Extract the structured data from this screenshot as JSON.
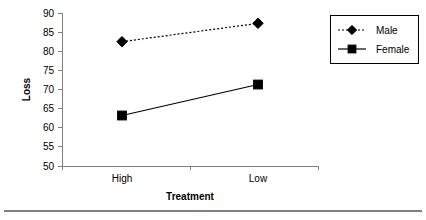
{
  "chart_data": {
    "type": "line",
    "title": "",
    "xlabel": "Treatment",
    "ylabel": "Loss",
    "categories": [
      "High",
      "Low"
    ],
    "series": [
      {
        "name": "Male",
        "values": [
          82.5,
          87.3
        ],
        "marker": "diamond",
        "line_style": "dashed",
        "color": "#000000"
      },
      {
        "name": "Female",
        "values": [
          63.2,
          71.3
        ],
        "marker": "square",
        "line_style": "solid",
        "color": "#000000"
      }
    ],
    "ylim": [
      50,
      90
    ],
    "ytick_step": 5,
    "yticks": [
      50,
      55,
      60,
      65,
      70,
      75,
      80,
      85,
      90
    ],
    "ytick_labels": [
      "50",
      "55",
      "60",
      "65",
      "70",
      "75",
      "80",
      "85",
      "90"
    ],
    "xticks": [
      "High",
      "Low"
    ],
    "grid": false,
    "legend_position": "right-top",
    "legend_entries": [
      "Male",
      "Female"
    ],
    "axis_color": "#808080",
    "plot_color": "#000000",
    "background": "#ffffff"
  },
  "footer": {
    "rule": true
  }
}
